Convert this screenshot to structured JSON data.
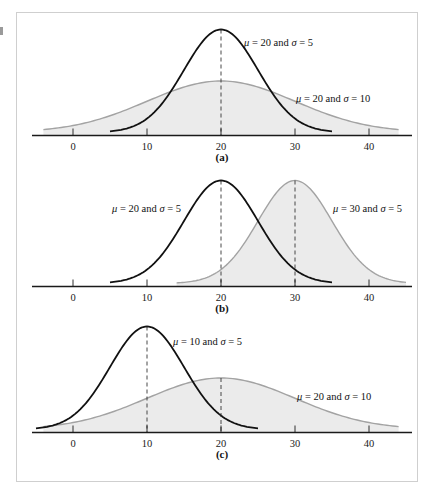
{
  "figure": {
    "panels": [
      {
        "id": "a",
        "caption": "(a)",
        "curves": [
          {
            "label": "μ = 20 and σ = 5",
            "mu": 20,
            "sigma": 5,
            "style": "dark",
            "annotation": {
              "mu": "20",
              "sigma": "5"
            }
          },
          {
            "label": "μ = 20 and σ = 10",
            "mu": 20,
            "sigma": 10,
            "style": "gray-filled",
            "annotation": {
              "mu": "20",
              "sigma": "10"
            }
          }
        ]
      },
      {
        "id": "b",
        "caption": "(b)",
        "curves": [
          {
            "label": "μ = 20 and σ = 5",
            "mu": 20,
            "sigma": 5,
            "style": "dark",
            "annotation": {
              "mu": "20",
              "sigma": "5"
            }
          },
          {
            "label": "μ = 30 and σ = 5",
            "mu": 30,
            "sigma": 5,
            "style": "gray-filled",
            "annotation": {
              "mu": "30",
              "sigma": "5"
            }
          }
        ]
      },
      {
        "id": "c",
        "caption": "(c)",
        "curves": [
          {
            "label": "μ = 10 and σ = 5",
            "mu": 10,
            "sigma": 5,
            "style": "dark",
            "annotation": {
              "mu": "10",
              "sigma": "5"
            }
          },
          {
            "label": "μ = 20 and σ = 10",
            "mu": 20,
            "sigma": 10,
            "style": "gray-filled",
            "annotation": {
              "mu": "20",
              "sigma": "10"
            }
          }
        ]
      }
    ],
    "tick_labels": [
      "0",
      "10",
      "20",
      "30",
      "40"
    ],
    "colors": {
      "dark_curve": "#111111",
      "gray_curve": "#a3a3a3",
      "fill": "#ebebeb",
      "frame": "#cfcfcf"
    }
  },
  "chart_data": [
    {
      "type": "line",
      "title": "(a)",
      "xlabel": "",
      "ylabel": "",
      "x_ticks": [
        0,
        10,
        20,
        30,
        40
      ],
      "xlim": [
        -5,
        45
      ],
      "grid": false,
      "series": [
        {
          "name": "μ = 20 and σ = 5",
          "distribution": "normal",
          "mu": 20,
          "sigma": 5,
          "x_range": [
            5,
            35
          ],
          "fill": false,
          "mean_marker": "dashed"
        },
        {
          "name": "μ = 20 and σ = 10",
          "distribution": "normal",
          "mu": 20,
          "sigma": 10,
          "x_range": [
            -4,
            44
          ],
          "fill": true
        }
      ]
    },
    {
      "type": "line",
      "title": "(b)",
      "xlabel": "",
      "ylabel": "",
      "x_ticks": [
        0,
        10,
        20,
        30,
        40
      ],
      "xlim": [
        -5,
        45
      ],
      "grid": false,
      "series": [
        {
          "name": "μ = 20 and σ = 5",
          "distribution": "normal",
          "mu": 20,
          "sigma": 5,
          "x_range": [
            5,
            35
          ],
          "fill": false,
          "mean_marker": "dashed"
        },
        {
          "name": "μ = 30 and σ = 5",
          "distribution": "normal",
          "mu": 30,
          "sigma": 5,
          "x_range": [
            14,
            45
          ],
          "fill": true,
          "mean_marker": "dashed"
        }
      ]
    },
    {
      "type": "line",
      "title": "(c)",
      "xlabel": "",
      "ylabel": "",
      "x_ticks": [
        0,
        10,
        20,
        30,
        40
      ],
      "xlim": [
        -5,
        45
      ],
      "grid": false,
      "series": [
        {
          "name": "μ = 10 and σ = 5",
          "distribution": "normal",
          "mu": 10,
          "sigma": 5,
          "x_range": [
            -5,
            25
          ],
          "fill": false,
          "mean_marker": "dashed"
        },
        {
          "name": "μ = 20 and σ = 10",
          "distribution": "normal",
          "mu": 20,
          "sigma": 10,
          "x_range": [
            -4,
            44
          ],
          "fill": true,
          "mean_marker": "dashed"
        }
      ]
    }
  ]
}
